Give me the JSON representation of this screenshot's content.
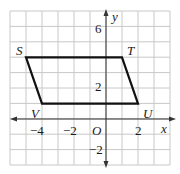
{
  "figure": {
    "type": "coordinate-grid",
    "grid": {
      "x_min": -6,
      "x_max": 4,
      "y_min": -3,
      "y_max": 7,
      "line_color": "#c8c8c8",
      "axis_color": "#333333"
    },
    "axes": {
      "x_label": "x",
      "y_label": "y",
      "origin_label": "O",
      "x_ticks": [
        {
          "value": -4,
          "label": "−4"
        },
        {
          "value": -2,
          "label": "−2"
        },
        {
          "value": 2,
          "label": "2"
        }
      ],
      "y_ticks": [
        {
          "value": 6,
          "label": "6"
        },
        {
          "value": 2,
          "label": "2"
        },
        {
          "value": -2,
          "label": "−2"
        }
      ]
    },
    "shape": {
      "name": "parallelogram STUV",
      "stroke_color": "#111111",
      "vertices": [
        {
          "label": "S",
          "x": -5,
          "y": 4
        },
        {
          "label": "T",
          "x": 1,
          "y": 4
        },
        {
          "label": "U",
          "x": 2,
          "y": 1
        },
        {
          "label": "V",
          "x": -4,
          "y": 1
        }
      ]
    }
  }
}
